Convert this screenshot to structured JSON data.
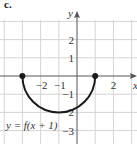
{
  "part_label": "c.",
  "chart_data": {
    "type": "line",
    "title": "",
    "xlabel": "x",
    "ylabel": "y",
    "function_label": "y = f(x + 1)",
    "xlim": [
      -4,
      3
    ],
    "ylim": [
      -3.3,
      3
    ],
    "grid": true,
    "x_tick_labels": [
      "-2",
      "-1",
      "2"
    ],
    "y_tick_labels": [
      "2",
      "1",
      "-1",
      "-2",
      "-3"
    ],
    "series": [
      {
        "name": "y = f(x + 1)",
        "shape": "lower semicircle",
        "center": [
          -1,
          0
        ],
        "radius": 2,
        "x": [
          -3,
          -2.5,
          -2,
          -1.5,
          -1,
          -0.5,
          0,
          0.5,
          1
        ],
        "y": [
          0,
          -1.32,
          -1.73,
          -1.94,
          -2,
          -1.94,
          -1.73,
          -1.32,
          0
        ],
        "endpoints": [
          [
            -3,
            0
          ],
          [
            1,
            0
          ]
        ],
        "endpoint_style": "filled"
      }
    ]
  },
  "colors": {
    "grid": "#d4d4d4",
    "axis": "#555555",
    "curve": "#1a1a1a",
    "text": "#333333"
  }
}
